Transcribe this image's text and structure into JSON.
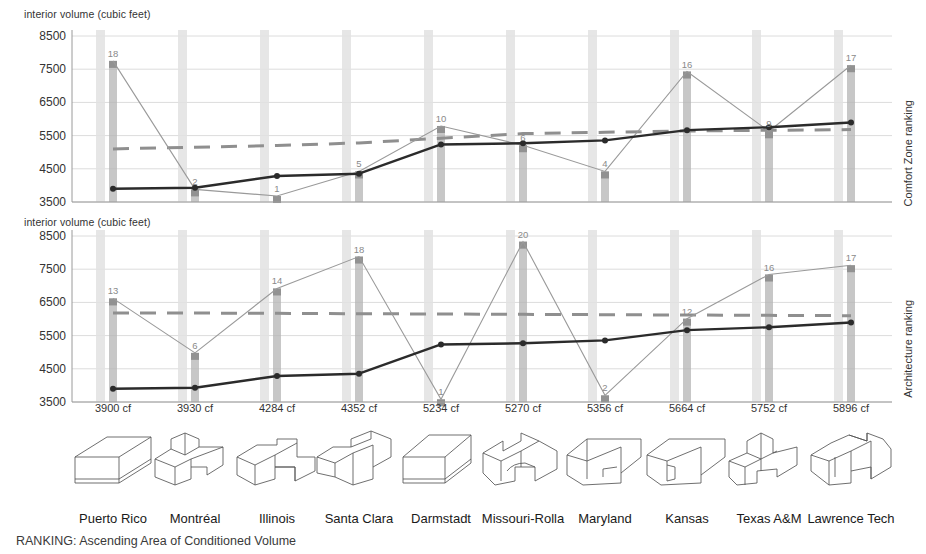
{
  "figure": {
    "caption": "RANKING: Ascending Area of Conditioned Volume",
    "y_axis_title": "interior volume (cubic feet)",
    "y_ticks": [
      "8500",
      "7500",
      "6500",
      "5500",
      "4500",
      "3500"
    ],
    "x_ticks": [
      "3900 cf",
      "3930 cf",
      "4284 cf",
      "4352 cf",
      "5234 cf",
      "5270 cf",
      "5356 cf",
      "5664 cf",
      "5752 cf",
      "5896 cf"
    ],
    "teams": [
      "Puerto Rico",
      "Montréal",
      "Illinois",
      "Santa Clara",
      "Darmstadt",
      "Missouri-Rolla",
      "Maryland",
      "Kansas",
      "Texas A&M",
      "Lawrence Tech"
    ],
    "panel1_side_label": "Comfort Zone ranking",
    "panel2_side_label": "Architecture ranking",
    "colors": {
      "volume_line": "#2b2b2b",
      "rank_line": "#9a9a9a",
      "average_dash": "#8f8f8f",
      "bar": "#b4b4b4",
      "bar_ghost": "#e2e2e2",
      "grid": "#dcdcdc",
      "axis": "#9a9a9a",
      "label_text": "#8a8a8a"
    }
  },
  "chart_data": [
    {
      "type": "line",
      "title": "Comfort Zone ranking",
      "ylabel": "interior volume (cubic feet)",
      "xlabel": "",
      "ylim": [
        3500,
        8500
      ],
      "grid": true,
      "legend": "none",
      "categories": [
        "3900 cf",
        "3930 cf",
        "4284 cf",
        "4352 cf",
        "5234 cf",
        "5270 cf",
        "5356 cf",
        "5664 cf",
        "5752 cf",
        "5896 cf"
      ],
      "team_names": [
        "Puerto Rico",
        "Montréal",
        "Illinois",
        "Santa Clara",
        "Darmstadt",
        "Missouri-Rolla",
        "Maryland",
        "Kansas",
        "Texas A&M",
        "Lawrence Tech"
      ],
      "series": [
        {
          "name": "interior volume",
          "values": [
            3900,
            3930,
            4284,
            4352,
            5234,
            5270,
            5356,
            5664,
            5752,
            5896
          ]
        },
        {
          "name": "Comfort Zone ranking (plotted as volume proxy)",
          "rank_values": [
            18,
            2,
            1,
            5,
            10,
            6,
            4,
            16,
            9,
            17
          ],
          "values": [
            7750,
            3880,
            3680,
            4420,
            5790,
            5210,
            4420,
            7430,
            5630,
            7620
          ],
          "point_labels": [
            "18",
            "2",
            "1",
            "5",
            "10",
            "6",
            "4",
            "16",
            "9",
            "17"
          ]
        },
        {
          "name": "average",
          "style": "dashed",
          "values": [
            5100,
            5150,
            5200,
            5280,
            5420,
            5560,
            5600,
            5640,
            5660,
            5680
          ]
        }
      ]
    },
    {
      "type": "line",
      "title": "Architecture ranking",
      "ylabel": "interior volume (cubic feet)",
      "xlabel": "",
      "ylim": [
        3500,
        8500
      ],
      "grid": true,
      "legend": "none",
      "categories": [
        "3900 cf",
        "3930 cf",
        "4284 cf",
        "4352 cf",
        "5234 cf",
        "5270 cf",
        "5356 cf",
        "5664 cf",
        "5752 cf",
        "5896 cf"
      ],
      "team_names": [
        "Puerto Rico",
        "Montréal",
        "Illinois",
        "Santa Clara",
        "Darmstadt",
        "Missouri-Rolla",
        "Maryland",
        "Kansas",
        "Texas A&M",
        "Lawrence Tech"
      ],
      "series": [
        {
          "name": "interior volume",
          "values": [
            3900,
            3930,
            4284,
            4352,
            5234,
            5270,
            5356,
            5664,
            5752,
            5896
          ]
        },
        {
          "name": "Architecture ranking (plotted as volume proxy)",
          "rank_values": [
            13,
            6,
            14,
            18,
            1,
            20,
            2,
            12,
            16,
            17
          ],
          "values": [
            6620,
            4980,
            6920,
            7880,
            3580,
            8330,
            3700,
            6010,
            7340,
            7620
          ],
          "point_labels": [
            "13",
            "6",
            "14",
            "18",
            "1",
            "20",
            "2",
            "12",
            "16",
            "17"
          ]
        },
        {
          "name": "average",
          "style": "dashed",
          "values": [
            6180,
            6180,
            6170,
            6160,
            6150,
            6140,
            6130,
            6120,
            6110,
            6100
          ]
        }
      ]
    }
  ]
}
